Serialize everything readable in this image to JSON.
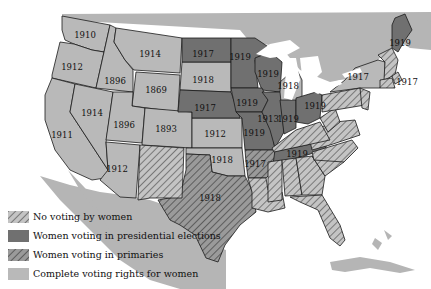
{
  "colors": {
    "water": "#ffffff",
    "land": "#b5b5b5",
    "complete": "#b9b9b9",
    "presidential": "#707070",
    "hatch_light_bg": "#c4c4c4",
    "hatch_dark_bg": "#9a9a9a",
    "hatch_line": "#444444",
    "border": "#1a1a1a"
  },
  "legend": [
    {
      "key": "none",
      "label": "No voting by women"
    },
    {
      "key": "presidential",
      "label": "Women voting in presidential elections"
    },
    {
      "key": "primaries",
      "label": "Women voting in primaries"
    },
    {
      "key": "complete",
      "label": "Complete voting rights for women"
    }
  ],
  "states": {
    "washington": "1910",
    "oregon": "1912",
    "california": "1911",
    "idaho": "1896",
    "nevada": "1914",
    "montana": "1914",
    "wyoming": "1869",
    "utah": "1896",
    "colorado": "1893",
    "arizona": "1912",
    "north_dakota": "1917",
    "south_dakota": "1918",
    "nebraska": "1917",
    "kansas": "1912",
    "oklahoma": "1918",
    "texas": "1918",
    "minnesota": "1919",
    "wisconsin": "1919",
    "iowa": "1919",
    "missouri": "1919",
    "illinois": "1913",
    "indiana": "1919",
    "michigan": "1918",
    "ohio": "1919",
    "arkansas": "1917",
    "tennessee": "1919",
    "new_york": "1917",
    "rhode_island": "1917",
    "maine": "1919"
  }
}
